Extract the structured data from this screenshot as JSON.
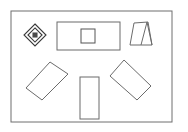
{
  "document": {
    "title": "Geometric Shape Diagram",
    "type": "line-drawing",
    "canvas": {
      "width": 188,
      "height": 132
    },
    "background_color": "#ffffff",
    "stroke_color": "#6b6b6b",
    "accent_stroke_color": "#3a3a3a"
  },
  "frame": {
    "name": "outer-border",
    "label": "",
    "x": 11,
    "y": 11,
    "width": 161,
    "height": 111,
    "stroke": "#6e6e6e"
  },
  "shapes": [
    {
      "id": "shape-1",
      "name": "nested-diamond",
      "label": "",
      "kind": "diamond",
      "center_x": 35,
      "center_y": 35,
      "radius": 11,
      "nesting_levels": 3,
      "stroke": "#3a3a3a"
    },
    {
      "id": "shape-2",
      "name": "wide-rectangle-with-inner-square",
      "label": "",
      "kind": "rectangle",
      "x": 57,
      "y": 22,
      "width": 63,
      "height": 28,
      "stroke": "#6b6b6b"
    },
    {
      "id": "shape-3",
      "name": "inner-square",
      "label": "",
      "kind": "square",
      "x": 81,
      "y": 29,
      "width": 14,
      "height": 14,
      "stroke": "#555555"
    },
    {
      "id": "shape-4",
      "name": "slanted-quadrilateral",
      "label": "",
      "kind": "polygon",
      "points": "134,23 148,22 152,45 130,45",
      "stroke": "#6b6b6b"
    },
    {
      "id": "shape-5",
      "name": "quadrilateral-diagonal-divider",
      "label": "",
      "kind": "line",
      "x1": 147,
      "y1": 22,
      "x2": 152,
      "y2": 45,
      "stroke": "#6b6b6b"
    },
    {
      "id": "shape-6",
      "name": "rotated-rectangle-left",
      "label": "",
      "kind": "polygon",
      "points": "50,62 68,74 42,100 26,88",
      "rotation_deg": -36,
      "stroke": "#6b6b6b"
    },
    {
      "id": "shape-7",
      "name": "vertical-rectangle-center",
      "label": "",
      "kind": "rectangle",
      "x": 80,
      "y": 77,
      "width": 19,
      "height": 42,
      "stroke": "#6b6b6b"
    },
    {
      "id": "shape-8",
      "name": "rotated-rectangle-right",
      "label": "",
      "kind": "polygon",
      "points": "124,60 110,76 137,100 151,86",
      "rotation_deg": 41,
      "stroke": "#6b6b6b"
    }
  ]
}
